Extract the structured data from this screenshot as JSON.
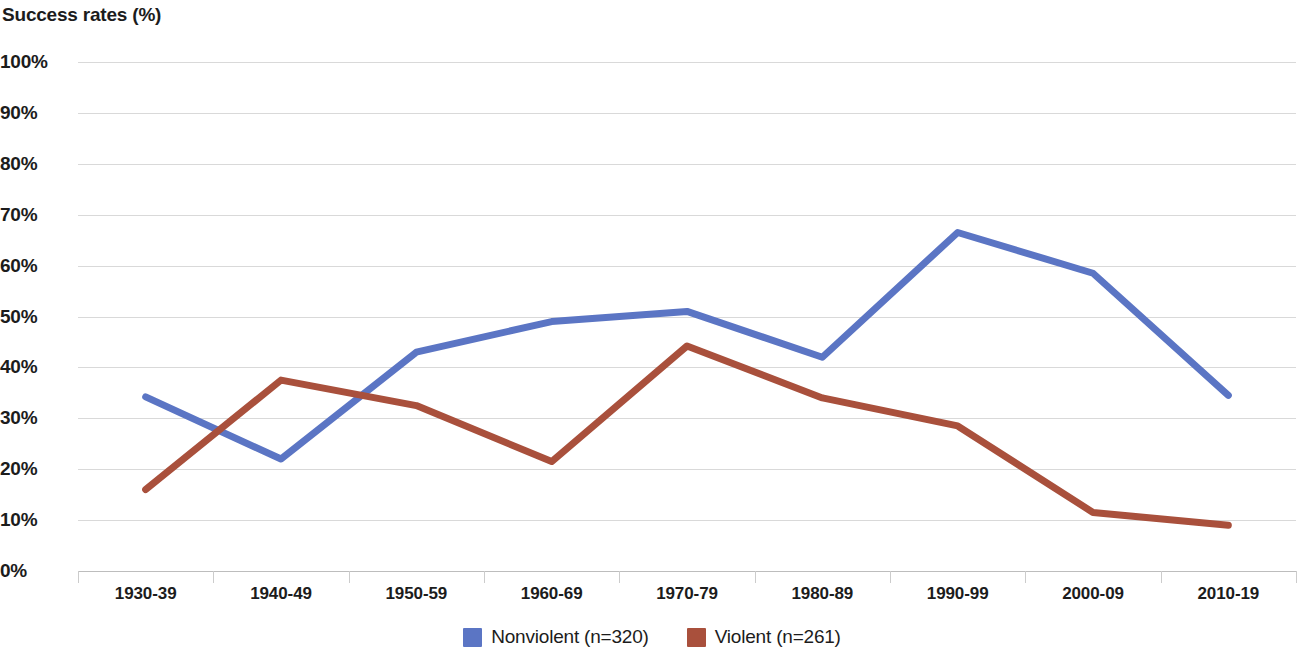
{
  "chart_data": {
    "type": "line",
    "title": "Success rates (%)",
    "xlabel": "",
    "ylabel": "",
    "ylim": [
      0,
      100
    ],
    "ytick_labels": [
      "100%",
      "90%",
      "80%",
      "70%",
      "60%",
      "50%",
      "40%",
      "30%",
      "20%",
      "10%",
      "0%"
    ],
    "ytick_values": [
      100,
      90,
      80,
      70,
      60,
      50,
      40,
      30,
      20,
      10,
      0
    ],
    "grid": true,
    "legend_position": "bottom",
    "categories": [
      "1930-39",
      "1940-49",
      "1950-59",
      "1960-69",
      "1970-79",
      "1980-89",
      "1990-99",
      "2000-09",
      "2010-19"
    ],
    "series": [
      {
        "name": "Nonviolent (n=320)",
        "color": "#5B75C4",
        "values": [
          34.2,
          22.0,
          43.0,
          49.0,
          51.0,
          42.0,
          66.5,
          58.5,
          34.5
        ]
      },
      {
        "name": "Violent (n=261)",
        "color": "#A9503C",
        "values": [
          16.0,
          37.5,
          32.5,
          21.5,
          44.2,
          34.0,
          28.5,
          11.5,
          9.0
        ]
      }
    ]
  },
  "legend": {
    "items": [
      {
        "label": "Nonviolent (n=320)",
        "color": "#5B75C4"
      },
      {
        "label": "Violent (n=261)",
        "color": "#A9503C"
      }
    ]
  }
}
